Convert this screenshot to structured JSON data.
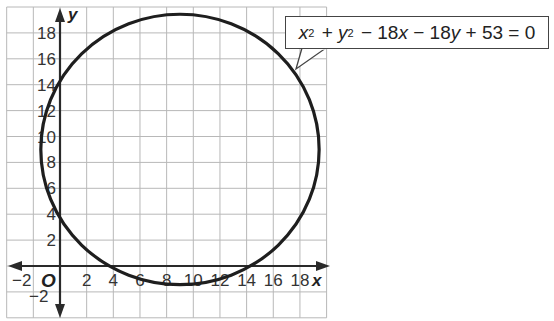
{
  "chart_data": {
    "type": "line",
    "title": "",
    "xlabel": "x",
    "ylabel": "y",
    "xlim": [
      -4,
      20
    ],
    "ylim": [
      -4,
      20
    ],
    "grid": true,
    "grid_step": 2,
    "x_ticks": [
      "-2",
      "2",
      "4",
      "6",
      "8",
      "10",
      "12",
      "14",
      "16",
      "18"
    ],
    "y_ticks": [
      "-2",
      "2",
      "4",
      "6",
      "8",
      "10",
      "12",
      "14",
      "16",
      "18"
    ],
    "origin_label": "O",
    "series": [
      {
        "name": "circle",
        "equation": "x^2 + y^2 - 18x - 18y + 53 = 0",
        "center": [
          9,
          9
        ],
        "radius": 10.44
      }
    ],
    "annotations": [
      {
        "text": "x² + y² − 18x − 18y + 53 = 0",
        "points_to": [
          17,
          16
        ]
      }
    ]
  },
  "callout": {
    "x": "x",
    "exp1": "2",
    "plus1": " + ",
    "y": "y",
    "exp2": "2",
    "rest1": " − 18",
    "x2": "x",
    "rest2": " − 18",
    "y2": "y",
    "rest3": " + 53 = 0"
  },
  "axes": {
    "x_label": "x",
    "y_label": "y",
    "origin": "O",
    "x_ticks": [
      {
        "v": 2,
        "t": "2"
      },
      {
        "v": 4,
        "t": "4"
      },
      {
        "v": 6,
        "t": "6"
      },
      {
        "v": 8,
        "t": "8"
      },
      {
        "v": 10,
        "t": "10"
      },
      {
        "v": 12,
        "t": "12"
      },
      {
        "v": 14,
        "t": "14"
      },
      {
        "v": 16,
        "t": "16"
      },
      {
        "v": 18,
        "t": "18"
      }
    ],
    "x_neg_tick": "−2",
    "y_ticks": [
      {
        "v": 2,
        "t": "2"
      },
      {
        "v": 4,
        "t": "4"
      },
      {
        "v": 6,
        "t": "6"
      },
      {
        "v": 8,
        "t": "8"
      },
      {
        "v": 10,
        "t": "10"
      },
      {
        "v": 12,
        "t": "12"
      },
      {
        "v": 14,
        "t": "14"
      },
      {
        "v": 16,
        "t": "16"
      },
      {
        "v": 18,
        "t": "18"
      }
    ],
    "y_neg_tick": "−2"
  },
  "colors": {
    "grid": "#b8b8b8",
    "axis": "#2a2a2a",
    "curve": "#1e1e1e"
  }
}
